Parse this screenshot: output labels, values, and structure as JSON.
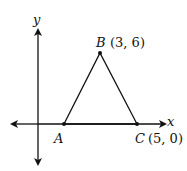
{
  "diagram": {
    "axes": {
      "x_label": "x",
      "y_label": "y"
    },
    "points": [
      {
        "name": "A",
        "coords": null,
        "label": "A"
      },
      {
        "name": "B",
        "coords": [
          3,
          6
        ],
        "label": "B",
        "coord_text": "(3, 6)"
      },
      {
        "name": "C",
        "coords": [
          5,
          0
        ],
        "label": "C",
        "coord_text": "(5, 0)"
      }
    ],
    "shape": "triangle ABC",
    "colors": {
      "stroke": "#111111",
      "background": "#ffffff"
    }
  }
}
